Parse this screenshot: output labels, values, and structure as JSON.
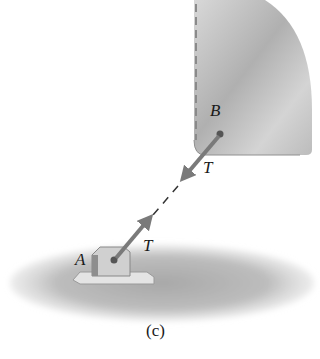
{
  "diagram": {
    "caption": "(c)",
    "points": {
      "A": {
        "label": "A"
      },
      "B": {
        "label": "B"
      }
    },
    "forces": [
      {
        "label": "T",
        "at": "B",
        "direction": "toward A"
      },
      {
        "label": "T",
        "at": "A",
        "direction": "toward B"
      }
    ],
    "colors": {
      "arrow": "#7a7a7a",
      "wall": "#c8c8c8",
      "ground": "#b8b8b8"
    }
  }
}
